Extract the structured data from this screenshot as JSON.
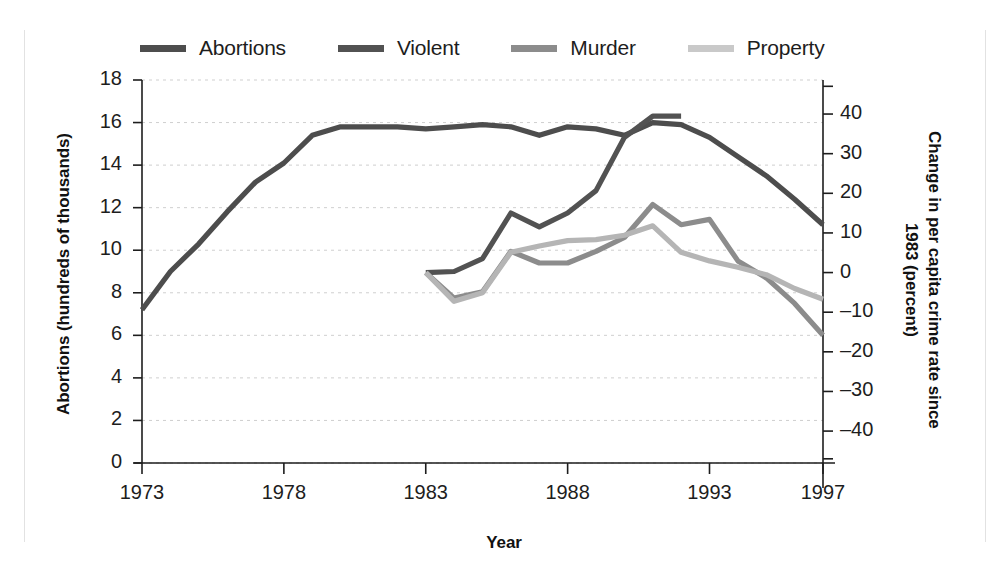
{
  "chart_data": {
    "type": "line",
    "title": "",
    "xlabel": "Year",
    "ylabel": "Abortions (hundreds of thousands)",
    "y2label": "Change in per capita crime rate since 1983 (percent)",
    "grid": true,
    "legend_position": "top",
    "xlim": [
      1973,
      1997
    ],
    "ylim": [
      0,
      18
    ],
    "y2lim": [
      -47,
      47
    ],
    "xticks": [
      "1973",
      "1978",
      "1983",
      "1988",
      "1993",
      "1997"
    ],
    "xtick_values": [
      1973,
      1978,
      1983,
      1988,
      1993,
      1997
    ],
    "yticks": [
      "0",
      "2",
      "4",
      "6",
      "8",
      "10",
      "12",
      "14",
      "16",
      "18"
    ],
    "ytick_values": [
      0,
      2,
      4,
      6,
      8,
      10,
      12,
      14,
      16,
      18
    ],
    "y2ticks": [
      "-40",
      "-30",
      "-20",
      "-10",
      "0",
      "10",
      "20",
      "30",
      "40"
    ],
    "y2tick_values": [
      -40,
      -30,
      -20,
      -10,
      0,
      10,
      20,
      30,
      40
    ],
    "series": [
      {
        "name": "Abortions",
        "color": "#4d4d4d",
        "axis": "left",
        "x": [
          1973,
          1974,
          1975,
          1976,
          1977,
          1978,
          1979,
          1980,
          1981,
          1982,
          1983,
          1984,
          1985,
          1986,
          1987,
          1988,
          1989,
          1990,
          1991,
          1992,
          1993,
          1994,
          1995,
          1996,
          1997
        ],
        "values": [
          7.2,
          9.0,
          10.3,
          11.8,
          13.2,
          14.1,
          15.4,
          15.8,
          15.8,
          15.8,
          15.7,
          15.8,
          15.9,
          15.8,
          15.4,
          15.8,
          15.7,
          15.4,
          16.0,
          15.9,
          15.3,
          14.4,
          13.5,
          12.4,
          11.2
        ]
      },
      {
        "name": "Violent",
        "color": "#525252",
        "axis": "right",
        "x": [
          1983,
          1984,
          1985,
          1986,
          1987,
          1988,
          1989,
          1990,
          1991,
          1992
        ],
        "values": [
          0.0,
          0.5,
          4.0,
          18.5,
          12.5,
          18.5,
          24.0,
          38.0,
          42.5,
          42.0
        ],
        "left_equivalent": [
          8.95,
          9.0,
          9.6,
          11.75,
          11.1,
          11.75,
          12.8,
          15.3,
          16.3,
          16.3
        ]
      },
      {
        "name": "Murder",
        "color": "#8c8c8c",
        "axis": "right",
        "x": [
          1983,
          1984,
          1985,
          1986,
          1987,
          1988,
          1989,
          1990,
          1991,
          1992,
          1993,
          1994,
          1995,
          1996,
          1997
        ],
        "values": [
          0.0,
          -10.0,
          -8.5,
          7.5,
          3.0,
          3.0,
          7.5,
          14.0,
          18.5,
          12.0,
          14.5,
          3.5,
          -2.0,
          -9.0,
          -19.0
        ],
        "left_equivalent": [
          8.95,
          7.75,
          8.05,
          9.95,
          9.4,
          9.4,
          9.95,
          10.6,
          12.15,
          11.2,
          11.45,
          9.5,
          8.7,
          7.5,
          6.0
        ]
      },
      {
        "name": "Property",
        "color": "#b5b5b5",
        "axis": "right",
        "x": [
          1983,
          1984,
          1985,
          1986,
          1987,
          1988,
          1989,
          1990,
          1991,
          1992,
          1993,
          1994,
          1995,
          1996,
          1997
        ],
        "values": [
          0.0,
          -12.0,
          -8.0,
          7.5,
          9.0,
          10.5,
          11.0,
          12.0,
          15.0,
          8.0,
          5.0,
          2.0,
          -1.0,
          -4.5,
          -6.0
        ],
        "left_equivalent": [
          8.95,
          7.6,
          8.0,
          9.9,
          10.2,
          10.45,
          10.5,
          10.7,
          11.15,
          9.9,
          9.5,
          9.2,
          8.85,
          8.2,
          7.7
        ]
      }
    ]
  },
  "legend": {
    "items": [
      {
        "label": "Abortions",
        "color": "#4d4d4d"
      },
      {
        "label": "Violent",
        "color": "#525252"
      },
      {
        "label": "Murder",
        "color": "#8c8c8c"
      },
      {
        "label": "Property",
        "color": "#b5b5b5"
      }
    ]
  },
  "axes": {
    "left_title": "Abortions (hundreds of thousands)",
    "right_title": "Change in per capita\ncrime rate since 1983 (percent)",
    "right_title_line1": "Change in per capita",
    "right_title_line2": "crime rate since 1983 (percent)",
    "x_title": "Year"
  }
}
